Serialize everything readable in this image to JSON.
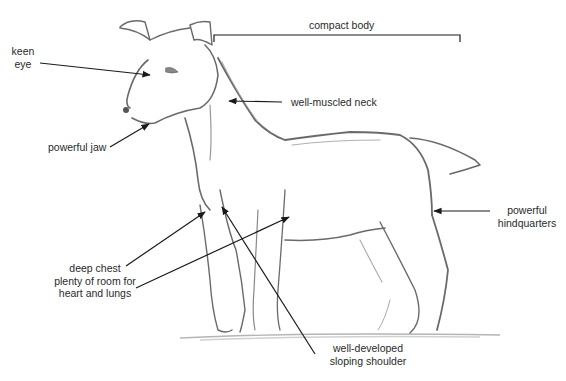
{
  "diagram": {
    "colors": {
      "ink": "#1a1a1a",
      "pencil": "#6a6a6a",
      "pencil_light": "#a8a8a8",
      "background": "#ffffff"
    },
    "labels": {
      "keen_eye": [
        "keen",
        "eye"
      ],
      "powerful_jaw": "powerful jaw",
      "compact_body": "compact body",
      "well_muscled_neck": "well-muscled neck",
      "deep_chest": [
        "deep chest",
        "plenty of room for",
        "heart and lungs"
      ],
      "powerful_hindquarters": [
        "powerful",
        "hindquarters"
      ],
      "sloping_shoulder": [
        "well-developed",
        "sloping shoulder"
      ]
    }
  }
}
